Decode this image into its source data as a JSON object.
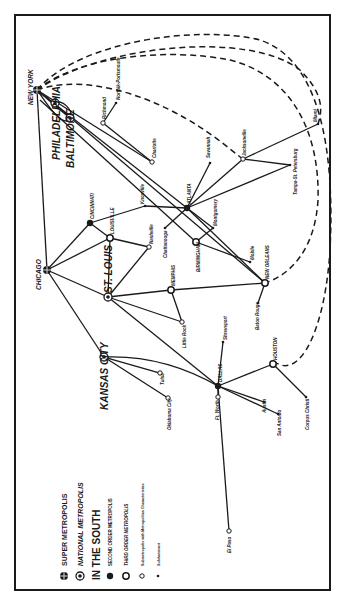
{
  "diagram": {
    "title_legend": {
      "super_metropolis": "SUPER METROPOLIS",
      "national_metropolis": "NATIONAL METROPOLIS",
      "region_heading": "IN THE SOUTH",
      "second_order": "SECOND ORDER METROPOLIS",
      "third_order": "THIRD ORDER METROPOLIS",
      "submetropolis": "Submetropolis with Metropolitan Characteristics",
      "submetropolis_short": "Submetropolis with Metropolitan Characteristics",
      "subdominant": "Subdominant"
    },
    "colors": {
      "ink": "#1a1a1a",
      "paper": "#ffffff"
    },
    "nodes": {
      "new_york": "NEW YORK",
      "philadelphia": "PHILADELPHIA",
      "baltimore": "BALTIMORE",
      "chicago": "CHICAGO",
      "cincinnati": "CINCINNATI",
      "louisville": "LOUISVILLE",
      "st_louis": "ST. LOUIS",
      "kansas_city": "KANSAS CITY",
      "atlanta": "ATLANTA",
      "birmingham": "BIRMINGHAM",
      "memphis": "MEMPHIS",
      "new_orleans": "NEW ORLEANS",
      "dallas": "DALLAS",
      "houston": "HOUSTON",
      "richmond": "Richmond",
      "norfolk": "Norfolk-Portsmouth",
      "charlotte": "Charlotte",
      "knoxville": "Knoxville",
      "nashville": "Nashville",
      "chattanooga": "Chattanooga",
      "montgomery": "Montgomery",
      "mobile": "Mobile",
      "savannah": "Savannah",
      "jacksonville": "Jacksonville",
      "miami": "Miami",
      "tampa": "Tampa-St. Petersburg",
      "little_rock": "Little Rock",
      "baton_rouge": "Baton Rouge",
      "shreveport": "Shreveport",
      "tulsa": "Tulsa",
      "oklahoma_city": "Oklahoma City",
      "ft_worth": "Ft. Worth",
      "austin": "Austin",
      "san_antonio": "San Antonio",
      "corpus_christi": "Corpus Christi",
      "el_paso": "El Paso"
    }
  }
}
